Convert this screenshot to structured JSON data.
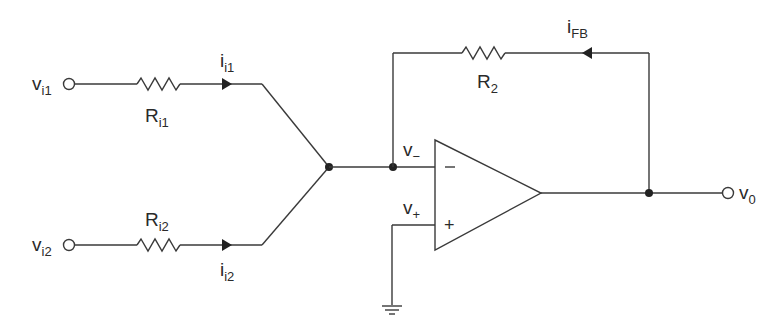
{
  "diagram": {
    "type": "inverting summing amplifier",
    "inputs": [
      {
        "voltage": {
          "main": "v",
          "sub": "i1"
        },
        "resistor": {
          "main": "R",
          "sub": "i1"
        },
        "current": {
          "main": "i",
          "sub": "i1"
        }
      },
      {
        "voltage": {
          "main": "v",
          "sub": "i2"
        },
        "resistor": {
          "main": "R",
          "sub": "i2"
        },
        "current": {
          "main": "i",
          "sub": "i2"
        }
      }
    ],
    "feedback": {
      "resistor": {
        "main": "R",
        "sub": "2"
      },
      "current": {
        "main": "i",
        "sub": "FB"
      }
    },
    "opamp": {
      "inverting": {
        "main": "v",
        "sub": "−",
        "sign": "−"
      },
      "noninverting": {
        "main": "v",
        "sub": "+",
        "sign": "+"
      }
    },
    "output": {
      "main": "v",
      "sub": "0"
    },
    "colors": {
      "line": "#3a3a3a",
      "text": "#2a2a2a",
      "background": "#ffffff"
    }
  }
}
